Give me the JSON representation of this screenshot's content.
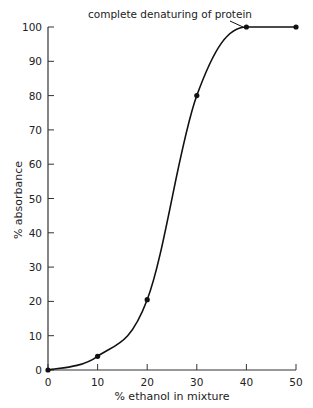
{
  "chart_data": {
    "type": "line",
    "title": "",
    "xlabel": "% ethanol in mixture",
    "ylabel": "% absorbance",
    "x": [
      0,
      10,
      20,
      30,
      40,
      50
    ],
    "series": [
      {
        "name": "absorbance",
        "values": [
          0,
          4,
          20.5,
          80,
          100,
          100
        ]
      }
    ],
    "xlim": [
      0,
      50
    ],
    "ylim": [
      0,
      100
    ],
    "xticks": [
      0,
      10,
      20,
      30,
      40,
      50
    ],
    "yticks": [
      0,
      10,
      20,
      30,
      40,
      50,
      60,
      70,
      80,
      90,
      100
    ],
    "grid": false,
    "annotations": [
      {
        "text": "complete denaturing of protein",
        "x": 40,
        "y": 100
      }
    ]
  }
}
